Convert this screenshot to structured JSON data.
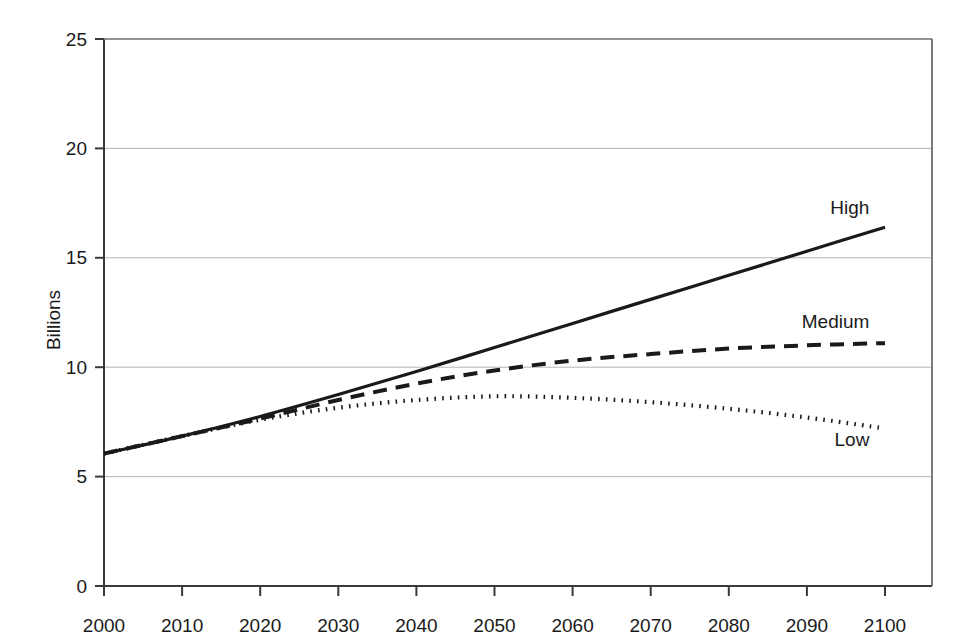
{
  "chart_data": {
    "type": "line",
    "title": "",
    "subtitle": "",
    "xlabel": "",
    "ylabel": "Billions",
    "xlim": [
      2000,
      2100
    ],
    "ylim": [
      0,
      25
    ],
    "grid": "horizontal",
    "legend_position": "inline-end-of-line",
    "x_ticks": [
      2000,
      2010,
      2020,
      2030,
      2040,
      2050,
      2060,
      2070,
      2080,
      2090,
      2100
    ],
    "x_tick_labels": [
      "2000",
      "2010",
      "2020",
      "2030",
      "2040",
      "2050",
      "2060",
      "2070",
      "2080",
      "2090",
      "2100"
    ],
    "y_ticks": [
      0,
      5,
      10,
      15,
      20,
      25
    ],
    "y_tick_labels": [
      "0",
      "5",
      "10",
      "15",
      "20",
      "25"
    ],
    "x": [
      2000,
      2010,
      2020,
      2030,
      2040,
      2050,
      2060,
      2070,
      2080,
      2090,
      2100
    ],
    "series": [
      {
        "name": "High",
        "label": "High",
        "style": "solid",
        "color": "#1a1a1a",
        "values": [
          6.05,
          6.85,
          7.75,
          8.75,
          9.8,
          10.9,
          12.0,
          13.1,
          14.2,
          15.3,
          16.4
        ]
      },
      {
        "name": "Medium",
        "label": "Medium",
        "style": "dashed",
        "color": "#1a1a1a",
        "values": [
          6.05,
          6.85,
          7.65,
          8.5,
          9.25,
          9.85,
          10.3,
          10.6,
          10.85,
          11.0,
          11.1
        ]
      },
      {
        "name": "Low",
        "label": "Low",
        "style": "dotted",
        "color": "#1a1a1a",
        "values": [
          6.05,
          6.85,
          7.6,
          8.15,
          8.5,
          8.67,
          8.6,
          8.4,
          8.1,
          7.7,
          7.2
        ]
      }
    ],
    "annotations": [
      {
        "text": "High",
        "x": 2098,
        "y": 17.3
      },
      {
        "text": "Medium",
        "x": 2098,
        "y": 12.1
      },
      {
        "text": "Low",
        "x": 2098,
        "y": 6.7
      }
    ],
    "colors": {
      "axis": "#3a3a3a",
      "gridline": "#b5b5b5",
      "line": "#1a1a1a",
      "background": "#ffffff",
      "text": "#1a1a1a"
    }
  }
}
